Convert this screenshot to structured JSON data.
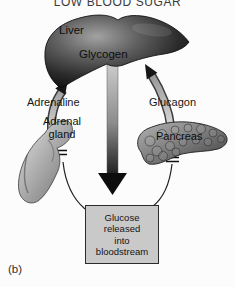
{
  "title": "LOW BLOOD SUGAR",
  "panel_label": "(b)",
  "organs": {
    "liver": {
      "name": "Liver",
      "store": "Glycogen"
    },
    "adrenal_gland": {
      "name": "Adrenal gland",
      "hormone": "Adrenaline"
    },
    "pancreas": {
      "name": "Pancreas",
      "hormone": "Glucagon"
    }
  },
  "output_box": {
    "lines": [
      "Glucose",
      "released",
      "into",
      "bloodstream"
    ]
  },
  "colors": {
    "background": "#fcfcfc",
    "box_fill": "#c9c9c9",
    "box_border": "#2b2b2b",
    "arrow_dark": "#0d0d0d",
    "organ_dark": "#0a0a0a",
    "organ_light": "#d8d8d8",
    "text": "#1a1a1a"
  }
}
